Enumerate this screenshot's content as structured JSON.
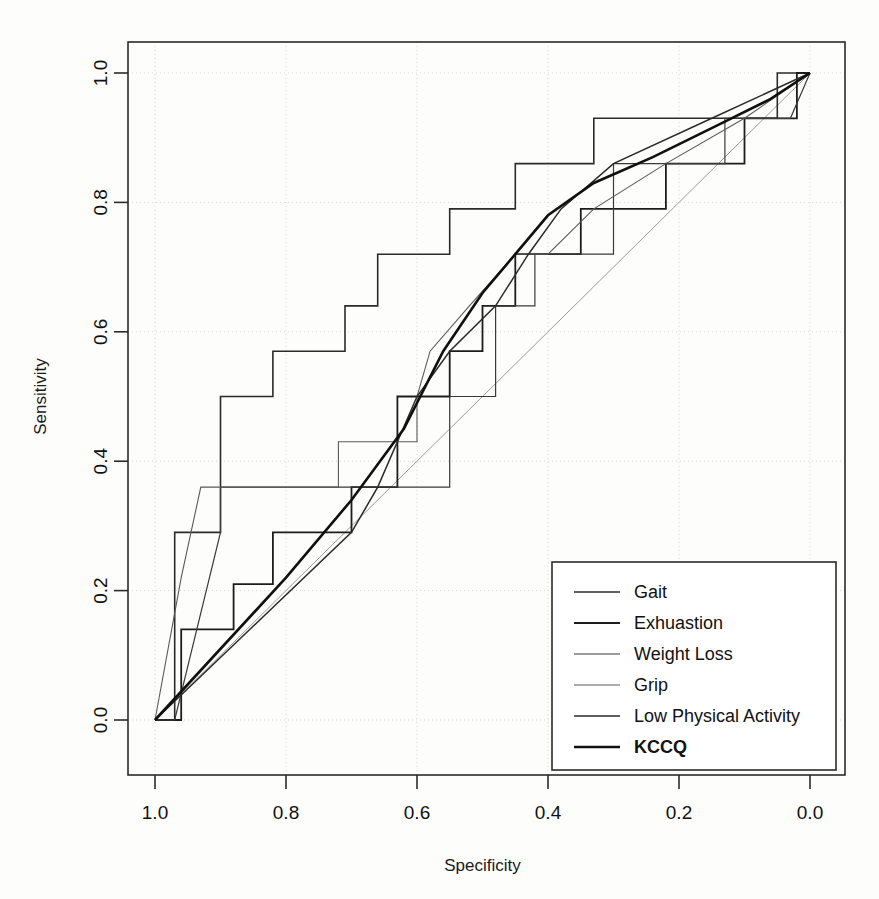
{
  "chart_data": {
    "type": "line",
    "title": "",
    "xlabel": "Specificity",
    "ylabel": "Sensitivity",
    "xlim": [
      1.0,
      0.0
    ],
    "ylim": [
      0.0,
      1.0
    ],
    "x_ticks": [
      "1.0",
      "0.8",
      "0.6",
      "0.4",
      "0.2",
      "0.0"
    ],
    "x_tick_values": [
      1.0,
      0.8,
      0.6,
      0.4,
      0.2,
      0.0
    ],
    "y_ticks": [
      "0.0",
      "0.2",
      "0.4",
      "0.6",
      "0.8",
      "1.0"
    ],
    "y_tick_values": [
      0.0,
      0.2,
      0.4,
      0.6,
      0.8,
      1.0
    ],
    "grid": true,
    "grid_style": "dotted",
    "x_axis_reversed": true,
    "legend_position": "bottom-right",
    "diagonal_reference_line": true,
    "series": [
      {
        "name": "Gait",
        "color": "#2b2b2b",
        "width": 1.6,
        "points": [
          [
            1.0,
            0.0
          ],
          [
            0.97,
            0.0
          ],
          [
            0.97,
            0.29
          ],
          [
            0.9,
            0.29
          ],
          [
            0.9,
            0.5
          ],
          [
            0.82,
            0.5
          ],
          [
            0.82,
            0.57
          ],
          [
            0.71,
            0.57
          ],
          [
            0.71,
            0.64
          ],
          [
            0.66,
            0.64
          ],
          [
            0.66,
            0.72
          ],
          [
            0.55,
            0.72
          ],
          [
            0.55,
            0.79
          ],
          [
            0.45,
            0.79
          ],
          [
            0.45,
            0.86
          ],
          [
            0.33,
            0.86
          ],
          [
            0.33,
            0.93
          ],
          [
            0.18,
            0.93
          ],
          [
            0.18,
            0.93
          ],
          [
            0.05,
            0.93
          ],
          [
            0.05,
            1.0
          ],
          [
            0.0,
            1.0
          ]
        ]
      },
      {
        "name": "Exhuastion",
        "color": "#1d1d1d",
        "width": 1.8,
        "points": [
          [
            1.0,
            0.0
          ],
          [
            0.96,
            0.0
          ],
          [
            0.96,
            0.14
          ],
          [
            0.88,
            0.14
          ],
          [
            0.88,
            0.21
          ],
          [
            0.82,
            0.21
          ],
          [
            0.82,
            0.29
          ],
          [
            0.7,
            0.29
          ],
          [
            0.7,
            0.36
          ],
          [
            0.63,
            0.36
          ],
          [
            0.63,
            0.5
          ],
          [
            0.55,
            0.5
          ],
          [
            0.55,
            0.57
          ],
          [
            0.5,
            0.57
          ],
          [
            0.5,
            0.64
          ],
          [
            0.45,
            0.64
          ],
          [
            0.45,
            0.72
          ],
          [
            0.35,
            0.72
          ],
          [
            0.35,
            0.79
          ],
          [
            0.22,
            0.79
          ],
          [
            0.22,
            0.86
          ],
          [
            0.1,
            0.86
          ],
          [
            0.1,
            0.93
          ],
          [
            0.02,
            0.93
          ],
          [
            0.02,
            1.0
          ],
          [
            0.0,
            1.0
          ]
        ]
      },
      {
        "name": "Weight Loss",
        "color": "#3a3a3a",
        "width": 1.2,
        "points": [
          [
            1.0,
            0.0
          ],
          [
            0.97,
            0.0
          ],
          [
            0.9,
            0.29
          ],
          [
            0.9,
            0.36
          ],
          [
            0.55,
            0.36
          ],
          [
            0.55,
            0.5
          ],
          [
            0.48,
            0.5
          ],
          [
            0.48,
            0.64
          ],
          [
            0.42,
            0.64
          ],
          [
            0.42,
            0.72
          ],
          [
            0.3,
            0.72
          ],
          [
            0.3,
            0.86
          ],
          [
            0.13,
            0.86
          ],
          [
            0.13,
            0.93
          ],
          [
            0.03,
            0.93
          ],
          [
            0.0,
            1.0
          ]
        ]
      },
      {
        "name": "Grip",
        "color": "#5a5a5a",
        "width": 1.1,
        "points": [
          [
            1.0,
            0.0
          ],
          [
            0.96,
            0.22
          ],
          [
            0.93,
            0.36
          ],
          [
            0.72,
            0.36
          ],
          [
            0.72,
            0.43
          ],
          [
            0.6,
            0.43
          ],
          [
            0.6,
            0.5
          ],
          [
            0.58,
            0.57
          ],
          [
            0.52,
            0.64
          ],
          [
            0.45,
            0.72
          ],
          [
            0.4,
            0.72
          ],
          [
            0.33,
            0.79
          ],
          [
            0.22,
            0.86
          ],
          [
            0.1,
            0.93
          ],
          [
            0.0,
            1.0
          ]
        ]
      },
      {
        "name": "Low Physical Activity",
        "color": "#2a2a2a",
        "width": 1.5,
        "points": [
          [
            1.0,
            0.0
          ],
          [
            0.7,
            0.29
          ],
          [
            0.66,
            0.36
          ],
          [
            0.63,
            0.43
          ],
          [
            0.6,
            0.5
          ],
          [
            0.55,
            0.57
          ],
          [
            0.48,
            0.64
          ],
          [
            0.43,
            0.72
          ],
          [
            0.38,
            0.79
          ],
          [
            0.3,
            0.86
          ],
          [
            0.15,
            0.93
          ],
          [
            0.0,
            1.0
          ]
        ]
      },
      {
        "name": "KCCQ",
        "color": "#101010",
        "width": 2.6,
        "points": [
          [
            1.0,
            0.0
          ],
          [
            0.8,
            0.22
          ],
          [
            0.7,
            0.34
          ],
          [
            0.62,
            0.45
          ],
          [
            0.56,
            0.57
          ],
          [
            0.5,
            0.66
          ],
          [
            0.45,
            0.72
          ],
          [
            0.4,
            0.78
          ],
          [
            0.33,
            0.83
          ],
          [
            0.24,
            0.87
          ],
          [
            0.14,
            0.92
          ],
          [
            0.06,
            0.96
          ],
          [
            0.0,
            1.0
          ]
        ]
      }
    ]
  },
  "legend": {
    "entries": [
      {
        "label": "Gait"
      },
      {
        "label": "Exhuastion"
      },
      {
        "label": "Weight Loss"
      },
      {
        "label": "Grip"
      },
      {
        "label": "Low Physical Activity"
      },
      {
        "label": "KCCQ"
      }
    ]
  }
}
